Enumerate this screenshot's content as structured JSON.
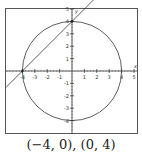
{
  "caption": "(−4, 0), (0, 4)",
  "chart_data": {
    "type": "line",
    "title": "",
    "xlabel": "x",
    "ylabel": "y",
    "xlim": [
      -5.3,
      5.2
    ],
    "ylim": [
      -5.2,
      5.2
    ],
    "x_ticks": [
      -4,
      -3,
      -2,
      -1,
      1,
      2,
      3,
      4,
      5
    ],
    "y_ticks": [
      -4,
      -3,
      -2,
      -1,
      1,
      2,
      3,
      4,
      5
    ],
    "grid": false,
    "series": [
      {
        "name": "circle x^2 + y^2 = 16",
        "kind": "circle",
        "center": [
          0,
          0
        ],
        "radius": 4
      },
      {
        "name": "line y = x + 4",
        "kind": "line",
        "slope": 1,
        "intercept": 4
      }
    ],
    "intersections": [
      [
        -4,
        0
      ],
      [
        0,
        4
      ]
    ]
  }
}
